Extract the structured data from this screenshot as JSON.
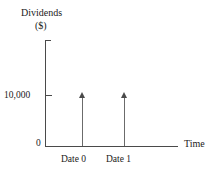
{
  "chart_data": {
    "type": "bar",
    "title": "",
    "ylabel": "Dividends",
    "ylabel_units": "($)",
    "xlabel": "Time",
    "categories": [
      "Date 0",
      "Date 1"
    ],
    "values": [
      10000,
      10000
    ],
    "value_labels": [
      "10,000",
      "10,000"
    ],
    "yticks": [
      0,
      10000
    ],
    "ytick_labels": [
      "0",
      "10,000"
    ],
    "ylim": [
      0,
      14000
    ],
    "grid": false,
    "legend": null,
    "annotations": [
      "Upward arrows at Date 0 and Date 1 each reach the 10,000 level, representing equal dividend cash inflows."
    ]
  },
  "figure": {
    "y_axis_title": "Dividends",
    "y_axis_units": "($)",
    "x_axis_title": "Time",
    "origin_label": "0",
    "y_tick_label": "10,000",
    "x_tick_labels": [
      "Date 0",
      "Date 1"
    ],
    "axis_color": "#4a4a4a",
    "arrow_color": "#6b6b6b",
    "background_color": "#ffffff"
  }
}
